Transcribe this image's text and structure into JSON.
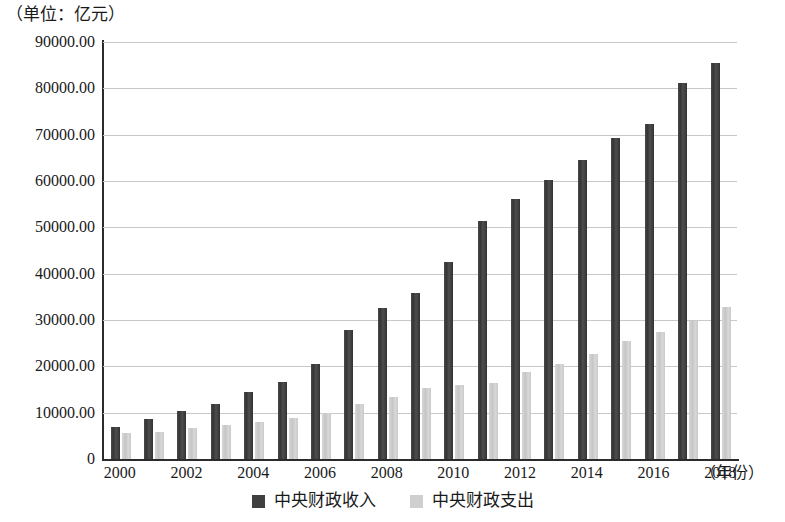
{
  "chart_data": {
    "type": "bar",
    "title": "",
    "unit_caption": "（单位：亿元）",
    "xlabel": "（年份）",
    "ylabel": "",
    "ylim": [
      0,
      90000
    ],
    "ytick_step": 10000,
    "grid": true,
    "legend_position": "bottom-center",
    "categories": [
      "2000",
      "2001",
      "2002",
      "2003",
      "2004",
      "2005",
      "2006",
      "2007",
      "2008",
      "2009",
      "2010",
      "2011",
      "2012",
      "2013",
      "2014",
      "2015",
      "2016",
      "2017",
      "2018"
    ],
    "xtick_labels": [
      "2000",
      "2002",
      "2004",
      "2006",
      "2008",
      "2010",
      "2012",
      "2014",
      "2016",
      "2018"
    ],
    "ytick_labels": [
      "90000.00",
      "80000.00",
      "70000.00",
      "60000.00",
      "50000.00",
      "40000.00",
      "30000.00",
      "20000.00",
      "10000.00",
      "0"
    ],
    "series": [
      {
        "name": "中央财政收入",
        "color": "#404040",
        "values": [
          6989,
          8583,
          10389,
          11865,
          14503,
          16548,
          20457,
          27749,
          32681,
          35916,
          42488,
          51327,
          56175,
          60198,
          64493,
          69267,
          72366,
          81119,
          85456
        ]
      },
      {
        "name": "中央财政支出",
        "color": "#cfcfcf",
        "values": [
          5520,
          5768,
          6772,
          7420,
          7894,
          8776,
          9991,
          11942,
          13345,
          15256,
          15990,
          16514,
          18765,
          20472,
          22570,
          25542,
          27404,
          29859,
          32708
        ]
      }
    ]
  },
  "legend": {
    "items": [
      {
        "label": "中央财政收入",
        "swatch": "revenue"
      },
      {
        "label": "中央财政支出",
        "swatch": "expenditure"
      }
    ]
  }
}
